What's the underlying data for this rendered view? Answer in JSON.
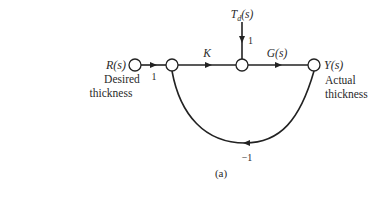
{
  "diagram": {
    "type": "signal-flow-graph",
    "caption": "(a)",
    "nodes": {
      "input": {
        "label": "R(s)",
        "description_line1": "Desired",
        "description_line2": "thickness"
      },
      "sum": {
        "label": ""
      },
      "disturbance_sum": {
        "label": ""
      },
      "output": {
        "label": "Y(s)",
        "description_line1": "Actual",
        "description_line2": "thickness"
      }
    },
    "disturbance": {
      "label_main": "T",
      "label_sub": "d",
      "label_arg": "(s)",
      "gain": "1"
    },
    "branches": [
      {
        "from": "input",
        "to": "sum",
        "gain": "1"
      },
      {
        "from": "sum",
        "to": "disturbance_sum",
        "gain": "K"
      },
      {
        "from": "disturbance_sum",
        "to": "output",
        "gain": "G(s)"
      },
      {
        "from": "output",
        "to": "sum",
        "gain": "−1"
      }
    ]
  }
}
